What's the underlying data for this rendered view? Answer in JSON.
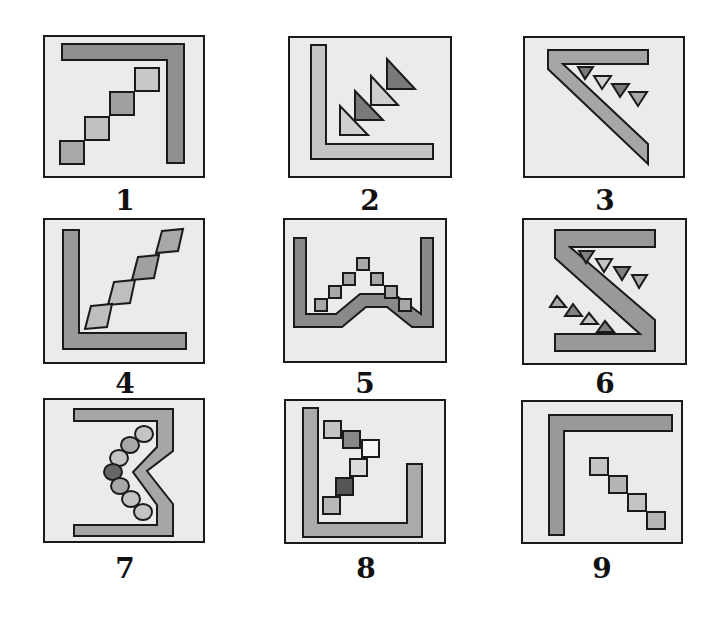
{
  "colors": {
    "panel_bg": "#ebebeb",
    "outline": "#1a1a1a",
    "dark": "#777777",
    "mid": "#9a9a9a",
    "light": "#c4c4c4",
    "pale": "#dcdcdc",
    "darkest": "#555555",
    "white": "#f4f4f4"
  },
  "panels": [
    {
      "label": "1",
      "description": "Inverted L bar (top and right) with four squares ascending diagonally"
    },
    {
      "label": "2",
      "description": "L bar (left and bottom) with four stacked right triangles ascending diagonally"
    },
    {
      "label": "3",
      "description": "Z-like diagonal bar with four downward triangles along the inside edge"
    },
    {
      "label": "4",
      "description": "L bar (left and bottom) with four tilted diamonds ascending diagonally"
    },
    {
      "label": "5",
      "description": "U-shaped bar with raised center and seven squares forming an inverted V"
    },
    {
      "label": "6",
      "description": "Z-shaped bar with two rows of four triangles on either side of the diagonal"
    },
    {
      "label": "7",
      "description": "Bracket bar with inward notch and seven circles forming a chevron"
    },
    {
      "label": "8",
      "description": "U bar with tall left arm and six squares forming a chevron"
    },
    {
      "label": "9",
      "description": "Inverted L bar (top and left) with four squares descending diagonally"
    }
  ]
}
